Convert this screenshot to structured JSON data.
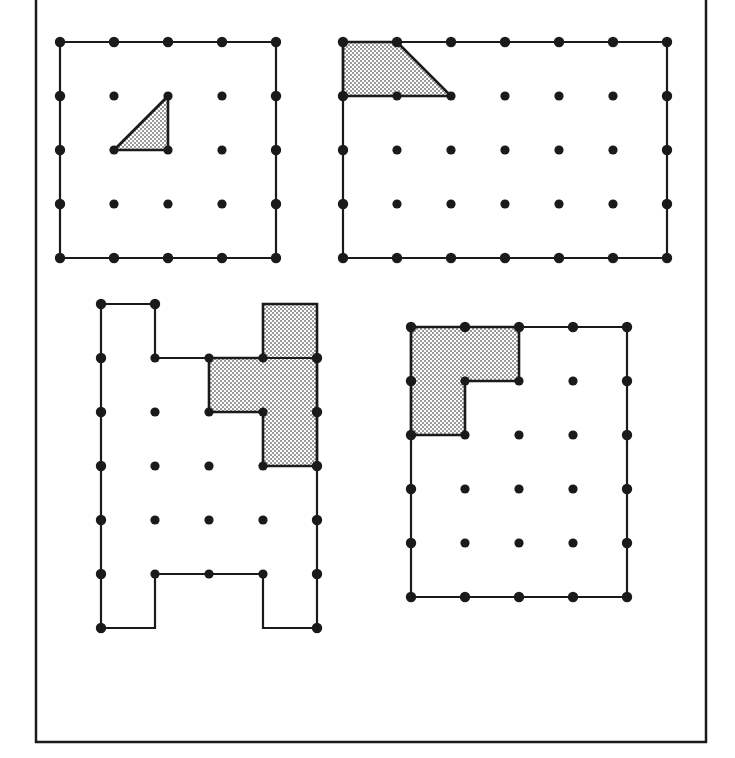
{
  "page": {
    "kind": "geoboard-worksheet",
    "background_color": "#ffffff",
    "line_color": "#1a1a1a",
    "dot_color": "#1a1a1a",
    "shade_color": "#b0b0b0",
    "shade_pattern": "checkerboard-dither",
    "width": 735,
    "height": 758
  },
  "frame": {
    "name": "page-border",
    "x": 36,
    "y": -20,
    "width": 670,
    "height": 762,
    "stroke_width": 2.5
  },
  "figures": [
    {
      "id": "figure-1",
      "label": "top-left-geoboard",
      "origin_x": 60,
      "origin_y": 42,
      "spacing": 54,
      "cols": 5,
      "rows": 5,
      "outline": [
        [
          0,
          0
        ],
        [
          4,
          0
        ],
        [
          4,
          4
        ],
        [
          0,
          4
        ]
      ],
      "shaded": [
        [
          1,
          2
        ],
        [
          2,
          1
        ],
        [
          2,
          2
        ]
      ],
      "shaded_kind": "right-triangle"
    },
    {
      "id": "figure-2",
      "label": "top-right-geoboard",
      "origin_x": 343,
      "origin_y": 42,
      "spacing": 54,
      "cols": 7,
      "rows": 5,
      "outline": [
        [
          0,
          0
        ],
        [
          6,
          0
        ],
        [
          6,
          4
        ],
        [
          0,
          4
        ]
      ],
      "shaded": [
        [
          0,
          0
        ],
        [
          1,
          0
        ],
        [
          2,
          1
        ],
        [
          0,
          1
        ]
      ],
      "shaded_kind": "trapezoid"
    },
    {
      "id": "figure-3",
      "label": "bottom-left-geoboard",
      "origin_x": 101,
      "origin_y": 304,
      "spacing": 54,
      "cols": 5,
      "rows": 7,
      "outline": [
        [
          0,
          0
        ],
        [
          1,
          0
        ],
        [
          1,
          1
        ],
        [
          4,
          1
        ],
        [
          4,
          6
        ],
        [
          3,
          6
        ],
        [
          3,
          5
        ],
        [
          1,
          5
        ],
        [
          1,
          6
        ],
        [
          0,
          6
        ]
      ],
      "shaded": [
        [
          3,
          0
        ],
        [
          4,
          0
        ],
        [
          4,
          3
        ],
        [
          3,
          3
        ],
        [
          3,
          2
        ],
        [
          2,
          2
        ],
        [
          2,
          1
        ],
        [
          3,
          1
        ]
      ],
      "shaded_kind": "z-polyomino"
    },
    {
      "id": "figure-4",
      "label": "bottom-right-geoboard",
      "origin_x": 411,
      "origin_y": 327,
      "spacing": 54,
      "cols": 5,
      "rows": 6,
      "outline": [
        [
          0,
          0
        ],
        [
          4,
          0
        ],
        [
          4,
          5
        ],
        [
          0,
          5
        ]
      ],
      "shaded": [
        [
          0,
          0
        ],
        [
          2,
          0
        ],
        [
          2,
          1
        ],
        [
          1,
          1
        ],
        [
          1,
          2
        ],
        [
          0,
          2
        ]
      ],
      "shaded_kind": "l-polyomino"
    }
  ]
}
